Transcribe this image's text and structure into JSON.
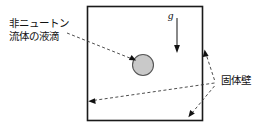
{
  "figure": {
    "background_color": "#ffffff",
    "line_color": "#1a1a1a",
    "dash_color": "#333333",
    "droplet_fill": "#c8c8c8",
    "droplet_stroke": "#555555",
    "labels": {
      "droplet_line1": "非ニュートン",
      "droplet_line2": "流体の液滴",
      "solid_wall": "固体壁",
      "gravity": "g"
    },
    "geometry": {
      "box": {
        "x": 87,
        "y": 6,
        "width": 116,
        "height": 115
      },
      "droplet": {
        "cx": 143,
        "cy": 65,
        "r": 10.5
      },
      "gravity_arrow": {
        "x": 177,
        "y_start": 18,
        "y_end": 52
      },
      "wall_junction": {
        "x": 217,
        "y": 83
      }
    }
  }
}
